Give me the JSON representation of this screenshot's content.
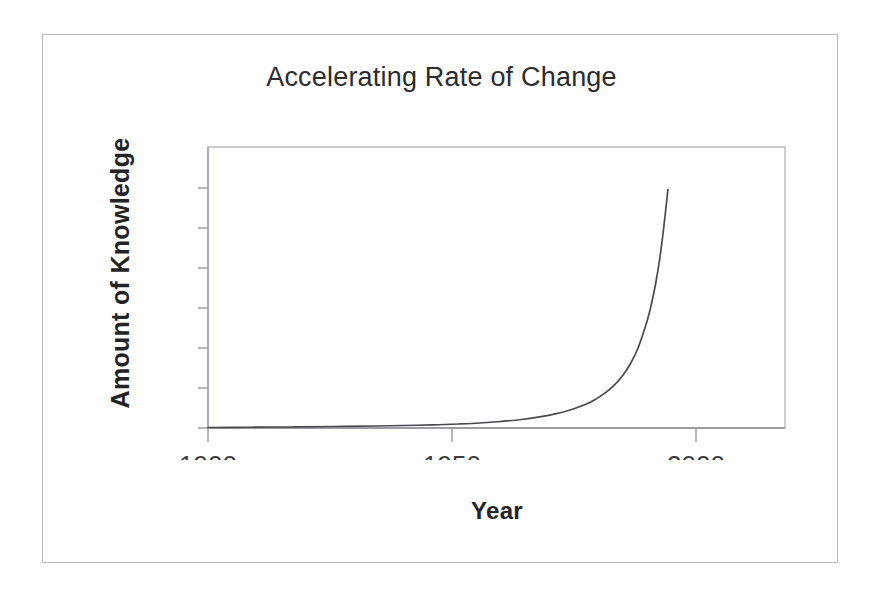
{
  "figure": {
    "title": "Accelerating Rate of Change",
    "x_axis_title": "Year",
    "y_axis_title": "Amount of Knowledge",
    "frame_color": "#b9b9bd",
    "axis_color": "#9a9aa0",
    "curve_color": "#4a4a50",
    "background": "#ffffff"
  },
  "chart_data": {
    "type": "line",
    "title": "Accelerating Rate of Change",
    "xlabel": "Year",
    "ylabel": "Amount of Knowledge",
    "xlim": [
      1900,
      2038
    ],
    "ylim": [
      0,
      1.12
    ],
    "grid": false,
    "legend": null,
    "x_ticks": [
      1900,
      1950,
      2000
    ],
    "x_tick_labels": [
      "1900",
      "1950",
      "2000"
    ],
    "y_ticks": [
      0,
      0.16,
      0.32,
      0.47,
      0.63,
      0.79,
      0.95
    ],
    "y_tick_labels": [
      "",
      "",
      "",
      "",
      "",
      "",
      ""
    ],
    "series": [
      {
        "name": "Amount of Knowledge",
        "x": [
          1900,
          1910,
          1920,
          1930,
          1940,
          1950,
          1955,
          1960,
          1965,
          1970,
          1975,
          1980,
          1983,
          1986,
          1989,
          1992,
          1995,
          1997,
          1999,
          2001,
          2003,
          2005,
          2006,
          2007,
          2008,
          2009,
          2010
        ],
        "y": [
          0.002,
          0.003,
          0.004,
          0.006,
          0.008,
          0.011,
          0.013,
          0.016,
          0.02,
          0.026,
          0.034,
          0.046,
          0.056,
          0.069,
          0.086,
          0.108,
          0.14,
          0.168,
          0.205,
          0.255,
          0.325,
          0.425,
          0.49,
          0.57,
          0.67,
          0.8,
          0.95
        ]
      }
    ]
  }
}
